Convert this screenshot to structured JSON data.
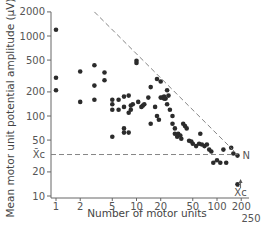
{
  "chart_data": {
    "type": "scatter",
    "title": "",
    "xlabel": "Number of motor units",
    "ylabel": "Mean motor unit potential amplitude (µV)",
    "xscale": "log",
    "yscale": "log",
    "xlim": [
      1,
      250
    ],
    "ylim": [
      10,
      2000
    ],
    "grid": false,
    "x_ticks": [
      1,
      2,
      5,
      10,
      20,
      50,
      100,
      200
    ],
    "x_tick_labels": [
      "1",
      "2",
      "5",
      "10",
      "20",
      "50",
      "100",
      "200"
    ],
    "x_extra_label": "250",
    "y_ticks": [
      10,
      20,
      50,
      100,
      200,
      500,
      1000,
      2000
    ],
    "y_tick_labels": [
      "10",
      "20",
      "50",
      "100",
      "200",
      "500",
      "1000",
      "2000"
    ],
    "annotations": {
      "xc_label": "X̄c",
      "xc_value": 33,
      "n_label": "N",
      "limit_line": {
        "from": [
          3.0,
          2000
        ],
        "to": [
          180,
          33
        ]
      }
    },
    "series": [
      {
        "name": "subjects",
        "points": [
          [
            1,
            1200
          ],
          [
            1,
            300
          ],
          [
            1,
            210
          ],
          [
            2,
            360
          ],
          [
            2,
            150
          ],
          [
            3,
            430
          ],
          [
            3,
            240
          ],
          [
            3,
            160
          ],
          [
            4,
            350
          ],
          [
            4,
            280
          ],
          [
            5,
            160
          ],
          [
            5,
            140
          ],
          [
            5,
            120
          ],
          [
            5,
            55
          ],
          [
            6,
            160
          ],
          [
            6,
            120
          ],
          [
            7,
            175
          ],
          [
            7,
            130
          ],
          [
            7,
            70
          ],
          [
            7,
            62
          ],
          [
            8,
            180
          ],
          [
            8,
            110
          ],
          [
            8,
            62
          ],
          [
            8.5,
            135
          ],
          [
            8.5,
            120
          ],
          [
            9,
            140
          ],
          [
            10,
            490
          ],
          [
            10,
            460
          ],
          [
            10.5,
            150
          ],
          [
            11.5,
            130
          ],
          [
            12,
            135
          ],
          [
            12.5,
            140
          ],
          [
            14,
            170
          ],
          [
            15,
            230
          ],
          [
            15,
            80
          ],
          [
            17,
            130
          ],
          [
            18,
            290
          ],
          [
            18,
            100
          ],
          [
            19,
            90
          ],
          [
            20,
            270
          ],
          [
            20,
            170
          ],
          [
            21,
            170
          ],
          [
            22,
            175
          ],
          [
            22,
            165
          ],
          [
            23,
            165
          ],
          [
            24,
            210
          ],
          [
            24,
            140
          ],
          [
            25,
            180
          ],
          [
            26,
            120
          ],
          [
            28,
            100
          ],
          [
            28,
            80
          ],
          [
            30,
            70
          ],
          [
            30,
            60
          ],
          [
            32,
            55
          ],
          [
            33,
            60
          ],
          [
            35,
            57
          ],
          [
            36,
            52
          ],
          [
            38,
            80
          ],
          [
            40,
            75
          ],
          [
            42,
            70
          ],
          [
            45,
            49
          ],
          [
            48,
            48
          ],
          [
            50,
            45
          ],
          [
            55,
            42
          ],
          [
            60,
            45
          ],
          [
            62,
            60
          ],
          [
            65,
            44
          ],
          [
            70,
            42
          ],
          [
            75,
            44
          ],
          [
            80,
            38
          ],
          [
            85,
            36
          ],
          [
            90,
            26
          ],
          [
            100,
            28
          ],
          [
            110,
            26
          ],
          [
            120,
            38
          ],
          [
            130,
            26
          ],
          [
            150,
            40
          ],
          [
            160,
            34
          ],
          [
            180,
            32
          ],
          [
            180,
            14
          ]
        ]
      }
    ]
  }
}
